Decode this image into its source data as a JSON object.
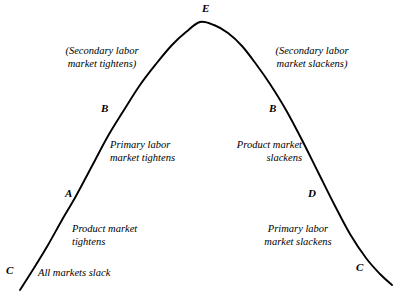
{
  "figure": {
    "kind": "bell-curve-diagram",
    "background_color": "#ffffff",
    "curve_color": "#000000",
    "text_color": "#000000"
  },
  "point_labels": {
    "c_left": "C",
    "a_left": "A",
    "b_left": "B",
    "e_apex": "E",
    "b_right": "B",
    "d_right": "D",
    "c_right": "C"
  },
  "region_labels": {
    "secondary_tightens_line1": "(Secondary labor",
    "secondary_tightens_line2": "market tightens)",
    "secondary_slackens_line1": "(Secondary labor",
    "secondary_slackens_line2": "market slackens)",
    "primary_tightens_line1": "Primary labor",
    "primary_tightens_line2": "market tightens",
    "product_slackens_line1": "Product market",
    "product_slackens_line2": "slackens",
    "product_tightens_line1": "Product market",
    "product_tightens_line2": "tightens",
    "primary_slackens_line1": "Primary labor",
    "primary_slackens_line2": "market slackens",
    "all_markets_slack": "All markets slack"
  },
  "chart_data": {
    "type": "line",
    "title": "",
    "xlabel": "",
    "ylabel": "",
    "grid": false,
    "legend": "none",
    "curve_shape": "bell",
    "annotations": [
      {
        "label": "C",
        "role": "left-tail-endpoint",
        "x": 20,
        "y": 290
      },
      {
        "label": "A",
        "role": "left-lower-inflection",
        "x": 80,
        "y": 196
      },
      {
        "label": "B",
        "role": "left-upper-inflection",
        "x": 112,
        "y": 112
      },
      {
        "label": "E",
        "role": "apex",
        "x": 200,
        "y": 22
      },
      {
        "label": "B",
        "role": "right-upper-inflection",
        "x": 281,
        "y": 112
      },
      {
        "label": "D",
        "role": "right-lower-inflection",
        "x": 318,
        "y": 196
      },
      {
        "label": "C",
        "role": "right-tail-endpoint",
        "x": 392,
        "y": 285
      }
    ],
    "series": [
      {
        "name": "tightness-curve",
        "points": [
          [
            20,
            290
          ],
          [
            34,
            268
          ],
          [
            48,
            245
          ],
          [
            62,
            220
          ],
          [
            76,
            196
          ],
          [
            92,
            166
          ],
          [
            108,
            136
          ],
          [
            124,
            110
          ],
          [
            140,
            85
          ],
          [
            156,
            64
          ],
          [
            172,
            45
          ],
          [
            186,
            32
          ],
          [
            200,
            22
          ],
          [
            214,
            25
          ],
          [
            228,
            33
          ],
          [
            242,
            46
          ],
          [
            256,
            64
          ],
          [
            270,
            84
          ],
          [
            286,
            110
          ],
          [
            302,
            140
          ],
          [
            318,
            172
          ],
          [
            334,
            204
          ],
          [
            350,
            234
          ],
          [
            366,
            258
          ],
          [
            380,
            274
          ],
          [
            392,
            285
          ]
        ]
      }
    ]
  }
}
